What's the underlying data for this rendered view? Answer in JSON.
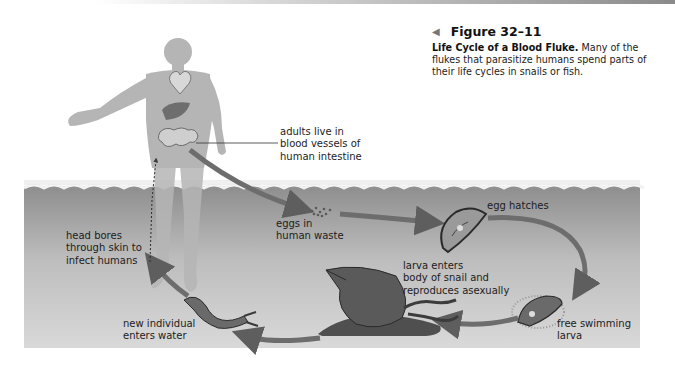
{
  "figure": {
    "number_label": "Figure 32–11",
    "title": "Life Cycle of a Blood Fluke.",
    "description": "Many of the flukes that parasitize humans spend parts of their life cycles in snails or fish.",
    "description_lines": [
      "Many of the",
      "flukes that parasitize humans spend parts of",
      "their life cycles in snails or fish."
    ]
  },
  "stages": [
    {
      "id": "adults",
      "lines": [
        "adults live in",
        "blood vessels of",
        "human intestine"
      ]
    },
    {
      "id": "eggs",
      "lines": [
        "eggs in",
        "human waste"
      ]
    },
    {
      "id": "egg-hatches",
      "lines": [
        "egg hatches"
      ]
    },
    {
      "id": "free-swimming-larva",
      "lines": [
        "free swimming",
        "larva"
      ]
    },
    {
      "id": "larva-enters-snail",
      "lines": [
        "larva enters",
        "body of snail and",
        "reproduces asexually"
      ]
    },
    {
      "id": "new-individual",
      "lines": [
        "new individual",
        "enters water"
      ]
    },
    {
      "id": "head-bores",
      "lines": [
        "head bores",
        "through skin to",
        "infect humans"
      ]
    }
  ],
  "colors": {
    "water_top": "#8f8f8f",
    "water_bottom": "#d6d6d6",
    "arrow": "#6e6e6e",
    "human": "#b3b3b3",
    "snail": "#555555"
  }
}
